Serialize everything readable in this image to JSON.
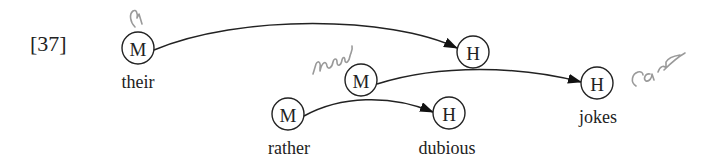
{
  "example_label": "[37]",
  "nodes": [
    {
      "id": "m_their",
      "type": "M",
      "word": "their",
      "cx": 138,
      "cy": 48
    },
    {
      "id": "h_top",
      "type": "H",
      "word": "",
      "cx": 473,
      "cy": 52
    },
    {
      "id": "m_new",
      "type": "M",
      "word": "",
      "cx": 361,
      "cy": 80
    },
    {
      "id": "h_jokes",
      "type": "H",
      "word": "jokes",
      "cx": 597,
      "cy": 83
    },
    {
      "id": "m_rather",
      "type": "M",
      "word": "rather",
      "cx": 288,
      "cy": 114
    },
    {
      "id": "h_dubious",
      "type": "H",
      "word": "dubious",
      "cx": 449,
      "cy": 113
    }
  ],
  "edges": [
    {
      "from": "m_their",
      "to": "h_top"
    },
    {
      "from": "m_new",
      "to": "h_jokes"
    },
    {
      "from": "m_rather",
      "to": "h_dubious"
    }
  ],
  "annotations": {
    "above_their": "a",
    "near_middle_m": "new",
    "after_jokes": "car"
  },
  "colors": {
    "ink": "#222222",
    "handwriting": "#9a9a9a"
  }
}
